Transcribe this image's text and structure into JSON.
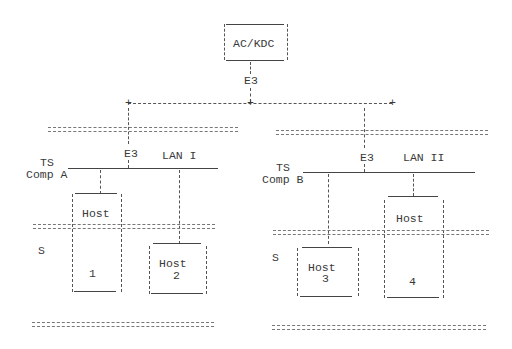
{
  "diagram": {
    "top_node": {
      "label": "AC/KDC",
      "link_label": "E3"
    },
    "left": {
      "terminal_server": {
        "line1": "TS",
        "line2": "Comp A"
      },
      "link_label": "E3",
      "lan_label": "LAN I",
      "security_label": "S",
      "hosts": [
        {
          "label": "Host",
          "number": "1"
        },
        {
          "label": "Host",
          "number": "2"
        }
      ]
    },
    "right": {
      "terminal_server": {
        "line1": "TS",
        "line2": "Comp B"
      },
      "link_label": "E3",
      "lan_label": "LAN II",
      "security_label": "S",
      "hosts": [
        {
          "label": "Host",
          "number": "3"
        },
        {
          "label": "Host",
          "number": "4"
        }
      ]
    },
    "junction_symbol": "+"
  }
}
